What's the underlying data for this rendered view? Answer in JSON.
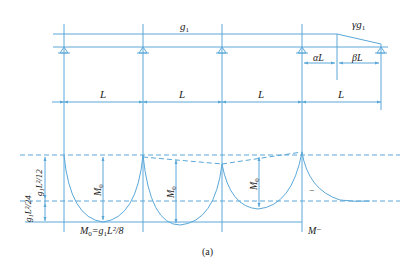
{
  "figure": {
    "caption": "(a)",
    "line_color": "#5aa8d8"
  },
  "beam": {
    "load_label": "g",
    "load_sub": "1",
    "end_load_label": "γg",
    "end_load_sub": "1",
    "alpha_label": "αL",
    "beta_label": "βL",
    "span_labels": [
      "L",
      "L",
      "L",
      "L"
    ]
  },
  "moment": {
    "m0_label": "M",
    "m0_sub": "0",
    "formula_m0": "M",
    "formula_sub": "0",
    "formula_rest": "=g",
    "formula_rest_sub": "1",
    "formula_tail": "L²/8",
    "left_upper": "g₁L²/12",
    "left_lower": "g₁L²/24",
    "m_minus": "M⁻",
    "minus_sign": "−"
  }
}
